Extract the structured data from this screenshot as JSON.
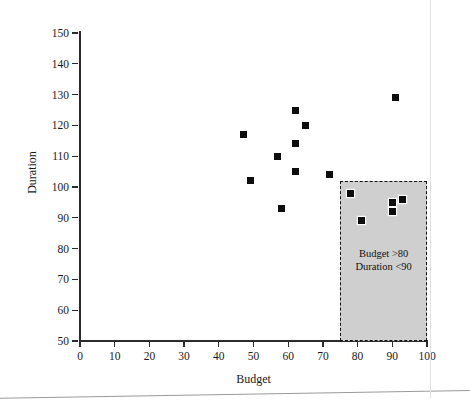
{
  "chart_data": {
    "type": "scatter",
    "title": "",
    "xlabel": "Budget",
    "ylabel": "Duration",
    "xlim": [
      0,
      100
    ],
    "ylim": [
      50,
      150
    ],
    "xticks": [
      0,
      10,
      20,
      30,
      40,
      50,
      60,
      70,
      80,
      90,
      100
    ],
    "yticks": [
      50,
      60,
      70,
      80,
      90,
      100,
      110,
      120,
      130,
      140,
      150
    ],
    "grid": false,
    "legend": null,
    "marker_style": "filled-square",
    "marker_color": "#0d0d0d",
    "points": [
      {
        "x": 47,
        "y": 117
      },
      {
        "x": 49,
        "y": 102
      },
      {
        "x": 57,
        "y": 110
      },
      {
        "x": 58,
        "y": 93
      },
      {
        "x": 62,
        "y": 125
      },
      {
        "x": 62,
        "y": 114
      },
      {
        "x": 62,
        "y": 105
      },
      {
        "x": 65,
        "y": 120
      },
      {
        "x": 72,
        "y": 104
      },
      {
        "x": 78,
        "y": 98
      },
      {
        "x": 81,
        "y": 89
      },
      {
        "x": 90,
        "y": 95
      },
      {
        "x": 90,
        "y": 92
      },
      {
        "x": 91,
        "y": 129
      },
      {
        "x": 93,
        "y": 96
      }
    ],
    "annotations": [
      {
        "name": "highlight-region",
        "kind": "shaded-rect",
        "x_range": [
          75,
          100
        ],
        "y_range": [
          50,
          102
        ],
        "fill_color": "#cfcfcf",
        "border_style": "dashed",
        "border_color": "#111111",
        "label_line1": "Budget >80",
        "label_line2": "Duration <90"
      }
    ]
  },
  "axes": {
    "y_title": "Duration",
    "x_title": "Budget",
    "y_tick_labels": [
      "150",
      "140",
      "130",
      "120",
      "110",
      "100",
      "90",
      "80",
      "70",
      "60",
      "50"
    ],
    "x_tick_labels": [
      "0",
      "10",
      "20",
      "30",
      "40",
      "50",
      "60",
      "70",
      "80",
      "90",
      "100"
    ]
  },
  "annotation": {
    "line1": "Budget >80",
    "line2": "Duration <90"
  }
}
